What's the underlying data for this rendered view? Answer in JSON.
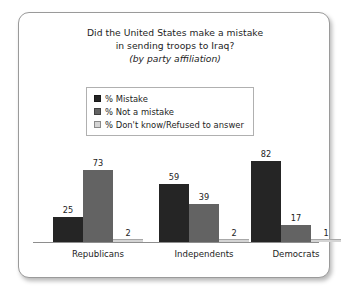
{
  "chart_data": {
    "type": "bar",
    "title": "Did the United States make a mistake in sending troops to Iraq?",
    "title_lines": [
      "Did the United States make a mistake",
      "in sending troops to Iraq?"
    ],
    "subtitle": "(by party affiliation)",
    "xlabel": "",
    "ylabel": "",
    "ylim": [
      0,
      100
    ],
    "grid": false,
    "legend_position": "top-center",
    "categories": [
      "Republicans",
      "Independents",
      "Democrats"
    ],
    "series": [
      {
        "name": "% Mistake",
        "color": "#252525",
        "values": [
          25,
          59,
          82
        ]
      },
      {
        "name": "% Not a mistake",
        "color": "#636363",
        "values": [
          73,
          39,
          17
        ]
      },
      {
        "name": "% Don't know/Refused to answer",
        "color": "#d4d4d4",
        "values": [
          2,
          2,
          1
        ]
      }
    ]
  },
  "frame": {
    "border_color": "#9a9a9a",
    "background": "#ffffff"
  }
}
